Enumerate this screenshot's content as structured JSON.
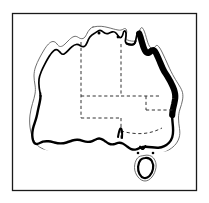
{
  "figure": {
    "background_color": "#ffffff",
    "ink_color": "#000000"
  },
  "frame": {
    "name": "figure-border",
    "x": 12.5,
    "y": 13.5,
    "width": 184,
    "height": 177,
    "stroke_width": 1.2,
    "color": "#1a1a1a"
  },
  "map": {
    "name": "australia-map",
    "landmass_label": "Australia",
    "fill_color": "#ffffff",
    "coast_color": "#000000",
    "offshore_contour_color": "#4d4d4d",
    "highlight_color": "#000000",
    "border_style": "dashed",
    "border_color": "#333333",
    "features": [
      {
        "name": "mainland-coastline",
        "style": "thin-line",
        "stroke_width": 1.6
      },
      {
        "name": "offshore-contour",
        "style": "thin-offset-line",
        "stroke_width": 0.9
      },
      {
        "name": "southern-coastline",
        "style": "medium-line",
        "stroke_width": 2.4
      },
      {
        "name": "east-coast-highlight",
        "style": "bold-line",
        "stroke_width": 6.5
      },
      {
        "name": "tasmania",
        "style": "island-outline",
        "stroke_width": 2.0
      },
      {
        "name": "state-borders",
        "style": "dashed-line",
        "stroke_width": 1.0
      }
    ],
    "state_borders": [
      {
        "name": "wa-nt-sa-border-vertical",
        "label": "Western Australia eastern border"
      },
      {
        "name": "nt-sa-border-horizontal",
        "label": "Northern Territory / South Australia border"
      },
      {
        "name": "nt-qld-border-vertical",
        "label": "Northern Territory / Queensland border"
      },
      {
        "name": "qld-nsw-border-horizontal",
        "label": "Queensland / New South Wales border"
      },
      {
        "name": "sa-nsw-vic-border",
        "label": "South Australia eastern border"
      },
      {
        "name": "nsw-vic-border",
        "label": "New South Wales / Victoria border"
      }
    ]
  }
}
